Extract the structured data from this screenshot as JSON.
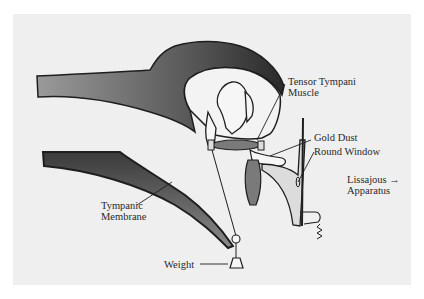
{
  "diagram": {
    "background_color": "#efefef",
    "ink_color": "#1e1e1e",
    "labels": {
      "tensor_tympani": {
        "line1": "Tensor Tympani",
        "line2": "Muscle"
      },
      "gold_dust": "Gold Dust",
      "round_window": "Round Window",
      "lissajous": {
        "line1": "Lissajous",
        "line2": "Apparatus",
        "arrow": "→"
      },
      "tympanic_membrane": {
        "line1": "Tympanic",
        "line2": "Membrane"
      },
      "weight": "Weight"
    }
  }
}
